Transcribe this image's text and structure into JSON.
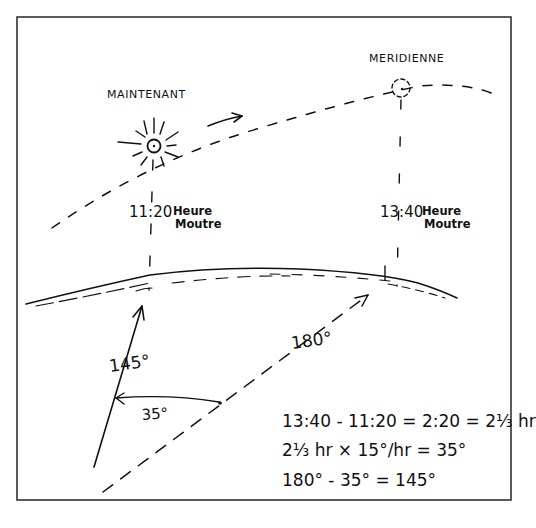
{
  "diagram": {
    "labels": {
      "now": "MAINTENANT",
      "noon": "MERIDIENNE"
    },
    "times": {
      "now_time": "11:20",
      "now_line1": "Heure",
      "now_line2": "Moutre",
      "noon_time": "13:40",
      "noon_line1": "Heure",
      "noon_line2": "Moutre"
    },
    "angles": {
      "bearing_now": "145°",
      "bearing_noon": "180°",
      "difference": "35°"
    },
    "calculations": [
      "13:40 - 11:20 = 2:20 = 2⅓ hr",
      "2⅓ hr × 15°/hr = 35°",
      "180° - 35° = 145°"
    ]
  }
}
